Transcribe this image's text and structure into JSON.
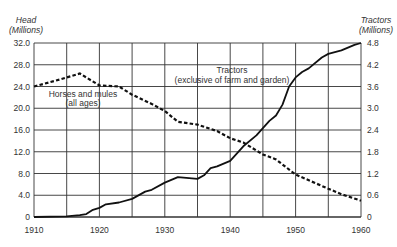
{
  "chart_data": {
    "type": "line",
    "title": "",
    "xlabel": "",
    "ylabel": "Head (Millions)",
    "ylabel_right": "Tractors (Millions)",
    "xlim": [
      1910,
      1960
    ],
    "ylim": [
      0,
      32
    ],
    "ylim_right": [
      0,
      4.8
    ],
    "grid": true,
    "x_ticks": [
      "1910",
      "1920",
      "1930",
      "1940",
      "1950",
      "1960"
    ],
    "y_ticks_left": [
      "0",
      "4.0",
      "8.0",
      "12.0",
      "16.0",
      "20.0",
      "24.0",
      "28.0",
      "32.0"
    ],
    "y_ticks_right": [
      "0",
      "0.6",
      "1.2",
      "1.8",
      "2.4",
      "3.0",
      "3.6",
      "4.2",
      "4.8"
    ],
    "series": [
      {
        "name": "Horses and mules (all ages)",
        "axis": "left",
        "style": "dashed",
        "x": [
          1910,
          1914,
          1917,
          1920,
          1923,
          1925,
          1928,
          1930,
          1932,
          1935,
          1938,
          1940,
          1942,
          1945,
          1947,
          1950,
          1955,
          1957,
          1960
        ],
        "values": [
          24.0,
          25.3,
          26.4,
          24.2,
          24.0,
          22.5,
          20.8,
          19.5,
          17.5,
          17.0,
          15.8,
          14.5,
          13.7,
          11.5,
          10.6,
          7.8,
          5.2,
          4.2,
          3.0
        ]
      },
      {
        "name": "Tractors (exclusive of farm and garden)",
        "axis": "right",
        "style": "solid",
        "x": [
          1910,
          1915,
          1917,
          1918,
          1919,
          1920,
          1921,
          1923,
          1925,
          1927,
          1928,
          1930,
          1932,
          1935,
          1936,
          1937,
          1938,
          1940,
          1942,
          1944,
          1945,
          1946,
          1947,
          1948,
          1949,
          1950,
          1951,
          1952,
          1954,
          1955,
          1957,
          1959,
          1960
        ],
        "values": [
          0,
          0.02,
          0.05,
          0.08,
          0.2,
          0.25,
          0.35,
          0.4,
          0.5,
          0.7,
          0.75,
          0.95,
          1.1,
          1.05,
          1.15,
          1.35,
          1.4,
          1.55,
          1.95,
          2.25,
          2.45,
          2.65,
          2.8,
          3.1,
          3.6,
          3.85,
          4.0,
          4.1,
          4.4,
          4.5,
          4.6,
          4.75,
          4.8
        ]
      }
    ],
    "annotations": [
      {
        "text": "Horses and mules",
        "line2": "(all ages)"
      },
      {
        "text": "Tractors",
        "line2": "(exclusive of farm and garden)"
      }
    ],
    "legend": "inline annotations"
  },
  "labels": {
    "left_title_1": "Head",
    "left_title_2": "(Millions)",
    "right_title_1": "Tractors",
    "right_title_2": "(Millions)",
    "horses_1": "Horses and mules",
    "horses_2": "(all ages)",
    "tractors_1": "Tractors",
    "tractors_2": "(exclusive of farm and garden)"
  },
  "colors": {
    "line": "#111111",
    "grid": "#333333",
    "text": "#333333"
  }
}
